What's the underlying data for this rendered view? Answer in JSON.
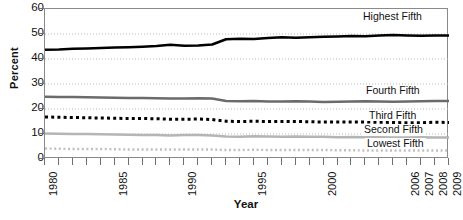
{
  "chart_data": {
    "type": "line",
    "title": "",
    "xlabel": "Year",
    "ylabel": "Percent",
    "xlim": [
      1980,
      2009
    ],
    "ylim": [
      0,
      60
    ],
    "grid": true,
    "legend_position": "inline-right",
    "x": [
      1980,
      1981,
      1982,
      1983,
      1984,
      1985,
      1986,
      1987,
      1988,
      1989,
      1990,
      1991,
      1992,
      1993,
      1994,
      1995,
      1996,
      1997,
      1998,
      1999,
      2000,
      2001,
      2002,
      2003,
      2004,
      2005,
      2006,
      2007,
      2008,
      2009
    ],
    "xtick_labels": [
      "1980",
      "1985",
      "1990",
      "1995",
      "2000",
      "2006",
      "2007",
      "2008",
      "2009"
    ],
    "xtick_values": [
      1980,
      1985,
      1990,
      1995,
      2000,
      2006,
      2007,
      2008,
      2009
    ],
    "ytick_labels": [
      "0",
      "10",
      "20",
      "30",
      "40",
      "50",
      "60"
    ],
    "ytick_values": [
      0,
      10,
      20,
      30,
      40,
      50,
      60
    ],
    "series": [
      {
        "name": "Highest Fifth",
        "style": "solid",
        "color": "#000000",
        "width": 2.6,
        "values": [
          43.7,
          43.8,
          44.1,
          44.2,
          44.4,
          44.6,
          44.7,
          44.9,
          45.2,
          45.7,
          45.3,
          45.4,
          45.8,
          47.9,
          48.1,
          48.0,
          48.4,
          48.7,
          48.5,
          48.7,
          48.9,
          49.0,
          49.2,
          49.1,
          49.4,
          49.6,
          49.4,
          49.3,
          49.4,
          49.4
        ]
      },
      {
        "name": "Fourth Fifth",
        "style": "solid",
        "color": "#6b6b6b",
        "width": 2.4,
        "values": [
          24.9,
          24.8,
          24.8,
          24.7,
          24.6,
          24.5,
          24.4,
          24.4,
          24.3,
          24.2,
          24.2,
          24.3,
          24.2,
          23.2,
          23.1,
          23.2,
          23.0,
          23.0,
          23.1,
          23.0,
          22.8,
          22.9,
          23.0,
          23.1,
          23.0,
          22.9,
          23.0,
          23.1,
          23.2,
          23.2
        ]
      },
      {
        "name": "Third Fifth",
        "style": "dotted",
        "color": "#000000",
        "width": 3.0,
        "values": [
          16.8,
          16.7,
          16.6,
          16.5,
          16.4,
          16.3,
          16.2,
          16.2,
          16.1,
          15.9,
          15.9,
          16.0,
          15.8,
          15.1,
          15.0,
          15.1,
          15.0,
          15.0,
          15.0,
          14.9,
          14.8,
          14.8,
          14.8,
          14.8,
          14.7,
          14.6,
          14.5,
          14.5,
          14.7,
          14.6
        ]
      },
      {
        "name": "Second Fifth",
        "style": "solid",
        "color": "#b5b5b5",
        "width": 2.4,
        "values": [
          10.2,
          10.1,
          10.0,
          10.0,
          9.9,
          9.8,
          9.7,
          9.6,
          9.6,
          9.4,
          9.6,
          9.6,
          9.4,
          9.0,
          8.9,
          9.1,
          9.0,
          8.9,
          9.0,
          8.9,
          8.9,
          8.7,
          8.8,
          8.7,
          8.7,
          8.6,
          8.6,
          8.7,
          8.6,
          8.6
        ]
      },
      {
        "name": "Lowest Fifth",
        "style": "dotted",
        "color": "#c0c0c0",
        "width": 2.4,
        "values": [
          4.2,
          4.1,
          4.0,
          4.0,
          4.0,
          3.9,
          3.8,
          3.8,
          3.8,
          3.8,
          3.8,
          3.8,
          3.8,
          3.6,
          3.6,
          3.7,
          3.6,
          3.6,
          3.6,
          3.6,
          3.6,
          3.5,
          3.5,
          3.4,
          3.4,
          3.4,
          3.4,
          3.4,
          3.4,
          3.4
        ]
      }
    ],
    "series_callouts": [
      {
        "name": "Highest Fifth",
        "x": 361,
        "y": 11
      },
      {
        "name": "Fourth Fifth",
        "x": 364,
        "y": 85
      },
      {
        "name": "Third Fifth",
        "x": 367,
        "y": 110
      },
      {
        "name": "Second Fifth",
        "x": 362,
        "y": 124
      },
      {
        "name": "Lowest Fifth",
        "x": 365,
        "y": 138
      }
    ]
  },
  "footnote": {
    "text": "______  ___ _ ____   ___"
  }
}
